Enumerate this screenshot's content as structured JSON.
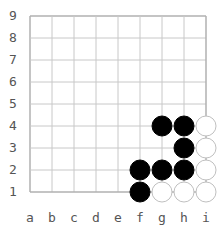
{
  "board": {
    "size": 9,
    "columns": [
      "a",
      "b",
      "c",
      "d",
      "e",
      "f",
      "g",
      "h",
      "i"
    ],
    "rows": [
      "9",
      "8",
      "7",
      "6",
      "5",
      "4",
      "3",
      "2",
      "1"
    ],
    "colors": {
      "background": "#ffffff",
      "grid_line": "#c8c8c8",
      "border": "#b0b0b0",
      "label": "#555555",
      "black_stone": "#000000",
      "white_stone_fill": "#ffffff",
      "white_stone_stroke": "#c0c0c0"
    },
    "stones": [
      {
        "color": "black",
        "point": "g4"
      },
      {
        "color": "black",
        "point": "h4"
      },
      {
        "color": "white",
        "point": "i4"
      },
      {
        "color": "black",
        "point": "h3"
      },
      {
        "color": "white",
        "point": "i3"
      },
      {
        "color": "black",
        "point": "f2"
      },
      {
        "color": "black",
        "point": "g2"
      },
      {
        "color": "black",
        "point": "h2"
      },
      {
        "color": "white",
        "point": "i2"
      },
      {
        "color": "black",
        "point": "f1"
      },
      {
        "color": "white",
        "point": "g1"
      },
      {
        "color": "white",
        "point": "h1"
      },
      {
        "color": "white",
        "point": "i1"
      }
    ]
  }
}
